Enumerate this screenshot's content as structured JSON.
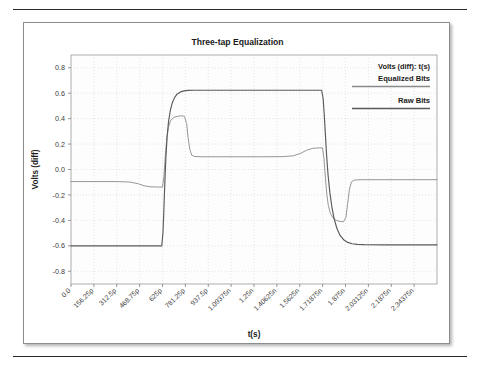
{
  "page": {
    "top_rule": "horizontal-rule",
    "bottom_rule": "horizontal-rule"
  },
  "chart_data": {
    "type": "line",
    "title": "Three-tap Equalization",
    "xlabel": "t(s)",
    "ylabel": "Volts (diff)",
    "grid": true,
    "legend_position": "top-right",
    "legend_header": "Volts (diff): t(s)",
    "xlim": [
      0,
      2.5
    ],
    "ylim": [
      -0.9,
      0.9
    ],
    "yticks": [
      0.8,
      0.6,
      0.4,
      0.2,
      0.0,
      -0.2,
      -0.4,
      -0.6,
      -0.8
    ],
    "ytick_labels": [
      "0.8",
      "0.6",
      "0.4",
      "0.2",
      "0.0",
      "-0.2",
      "-0.4",
      "-0.6",
      "-0.8"
    ],
    "xticks": [
      0,
      0.15625,
      0.3125,
      0.46875,
      0.625,
      0.78125,
      0.9375,
      1.09375,
      1.25,
      1.40625,
      1.5625,
      1.71875,
      1.875,
      2.03125,
      2.1875,
      2.34375
    ],
    "xtick_labels": [
      "0.0",
      "156.25p",
      "312.5p",
      "468.75p",
      "625p",
      "781.25p",
      "937.5p",
      "1.09375n",
      "1.25n",
      "1.40625n",
      "1.5625n",
      "1.71875n",
      "1.875n",
      "2.03125n",
      "2.1875n",
      "2.34375n"
    ],
    "series": [
      {
        "name": "Equalized Bits",
        "color": "#8a8a8a",
        "width": 0.9,
        "legend_swatch": "thin-gray-line",
        "points": [
          [
            0.0,
            -0.095
          ],
          [
            0.3,
            -0.095
          ],
          [
            0.4,
            -0.098
          ],
          [
            0.46,
            -0.112
          ],
          [
            0.5,
            -0.128
          ],
          [
            0.54,
            -0.136
          ],
          [
            0.6,
            -0.138
          ],
          [
            0.625,
            -0.138
          ],
          [
            0.635,
            -0.05
          ],
          [
            0.645,
            0.12
          ],
          [
            0.655,
            0.25
          ],
          [
            0.665,
            0.33
          ],
          [
            0.68,
            0.383
          ],
          [
            0.7,
            0.408
          ],
          [
            0.725,
            0.418
          ],
          [
            0.755,
            0.422
          ],
          [
            0.775,
            0.418
          ],
          [
            0.79,
            0.36
          ],
          [
            0.8,
            0.25
          ],
          [
            0.812,
            0.155
          ],
          [
            0.825,
            0.112
          ],
          [
            0.845,
            0.102
          ],
          [
            0.9,
            0.1
          ],
          [
            1.1,
            0.1
          ],
          [
            1.3,
            0.1
          ],
          [
            1.45,
            0.101
          ],
          [
            1.52,
            0.108
          ],
          [
            1.57,
            0.128
          ],
          [
            1.61,
            0.152
          ],
          [
            1.65,
            0.166
          ],
          [
            1.7,
            0.17
          ],
          [
            1.718,
            0.17
          ],
          [
            1.728,
            0.09
          ],
          [
            1.738,
            -0.07
          ],
          [
            1.748,
            -0.2
          ],
          [
            1.758,
            -0.285
          ],
          [
            1.772,
            -0.345
          ],
          [
            1.79,
            -0.382
          ],
          [
            1.812,
            -0.4
          ],
          [
            1.84,
            -0.409
          ],
          [
            1.862,
            -0.41
          ],
          [
            1.878,
            -0.375
          ],
          [
            1.89,
            -0.265
          ],
          [
            1.902,
            -0.155
          ],
          [
            1.915,
            -0.098
          ],
          [
            1.935,
            -0.083
          ],
          [
            1.98,
            -0.08
          ],
          [
            2.15,
            -0.08
          ],
          [
            2.35,
            -0.08
          ],
          [
            2.5,
            -0.08
          ]
        ]
      },
      {
        "name": "Raw Bits",
        "color": "#5a5a5a",
        "width": 1.15,
        "legend_swatch": "thick-dark-line",
        "points": [
          [
            0.0,
            -0.6
          ],
          [
            0.3,
            -0.6
          ],
          [
            0.5,
            -0.6
          ],
          [
            0.62,
            -0.6
          ],
          [
            0.628,
            -0.5
          ],
          [
            0.634,
            -0.33
          ],
          [
            0.64,
            -0.13
          ],
          [
            0.648,
            0.09
          ],
          [
            0.656,
            0.25
          ],
          [
            0.666,
            0.375
          ],
          [
            0.678,
            0.462
          ],
          [
            0.692,
            0.525
          ],
          [
            0.708,
            0.567
          ],
          [
            0.726,
            0.594
          ],
          [
            0.748,
            0.61
          ],
          [
            0.772,
            0.618
          ],
          [
            0.8,
            0.622
          ],
          [
            0.84,
            0.623
          ],
          [
            0.9,
            0.623
          ],
          [
            1.1,
            0.623
          ],
          [
            1.3,
            0.623
          ],
          [
            1.5,
            0.623
          ],
          [
            1.65,
            0.623
          ],
          [
            1.712,
            0.623
          ],
          [
            1.722,
            0.56
          ],
          [
            1.73,
            0.43
          ],
          [
            1.738,
            0.27
          ],
          [
            1.746,
            0.11
          ],
          [
            1.756,
            -0.045
          ],
          [
            1.768,
            -0.18
          ],
          [
            1.782,
            -0.295
          ],
          [
            1.798,
            -0.39
          ],
          [
            1.816,
            -0.462
          ],
          [
            1.838,
            -0.518
          ],
          [
            1.862,
            -0.552
          ],
          [
            1.89,
            -0.573
          ],
          [
            1.92,
            -0.584
          ],
          [
            1.955,
            -0.589
          ],
          [
            2.0,
            -0.591
          ],
          [
            2.15,
            -0.592
          ],
          [
            2.35,
            -0.592
          ],
          [
            2.5,
            -0.592
          ]
        ]
      }
    ]
  }
}
